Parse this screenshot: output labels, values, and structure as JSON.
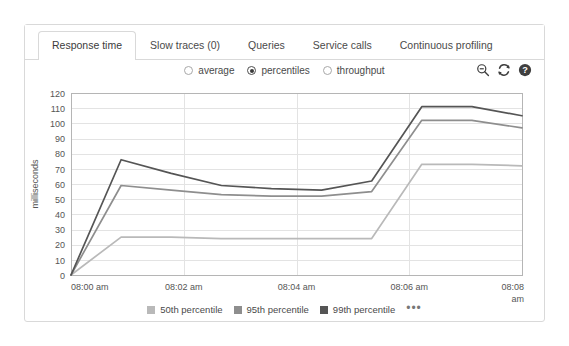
{
  "tabs": [
    {
      "label": "Response time",
      "active": true
    },
    {
      "label": "Slow traces (0)",
      "active": false
    },
    {
      "label": "Queries",
      "active": false
    },
    {
      "label": "Service calls",
      "active": false
    },
    {
      "label": "Continuous profiling",
      "active": false
    }
  ],
  "options": {
    "radios": [
      {
        "label": "average",
        "checked": false
      },
      {
        "label": "percentiles",
        "checked": true
      },
      {
        "label": "throughput",
        "checked": false
      }
    ]
  },
  "toolbar": {
    "icons": [
      {
        "name": "zoom-out-icon",
        "title": "Zoom out"
      },
      {
        "name": "refresh-icon",
        "title": "Refresh"
      },
      {
        "name": "help-icon",
        "title": "Help"
      }
    ]
  },
  "legend": {
    "items": [
      {
        "label": "50th percentile",
        "color": "#b9b9b9"
      },
      {
        "label": "95th percentile",
        "color": "#8e8e8e"
      },
      {
        "label": "99th percentile",
        "color": "#555555"
      }
    ],
    "more_label": "•••"
  },
  "chart_data": {
    "type": "line",
    "title": "",
    "xlabel": "",
    "ylabel": "milliseconds",
    "ylim": [
      0,
      120
    ],
    "yticks": [
      0,
      10,
      20,
      30,
      40,
      50,
      60,
      70,
      80,
      90,
      100,
      110,
      120
    ],
    "grid": true,
    "legend_position": "bottom",
    "x": [
      "08:00 am",
      "08:00:30 am",
      "08:01 am",
      "08:02 am",
      "08:03 am",
      "08:04 am",
      "08:05 am",
      "08:06 am",
      "08:07 am",
      "08:08 am"
    ],
    "xtick_labels": [
      "08:00 am",
      "08:02 am",
      "08:04 am",
      "08:06 am",
      "08:08 am"
    ],
    "xtick_last_wrap": "am",
    "xtick_last_main": "08:08",
    "series": [
      {
        "name": "50th percentile",
        "color": "#b9b9b9",
        "values": [
          0,
          25,
          25,
          24,
          24,
          24,
          24,
          73,
          73,
          72
        ]
      },
      {
        "name": "95th percentile",
        "color": "#8e8e8e",
        "values": [
          0,
          59,
          56,
          53,
          52,
          52,
          55,
          102,
          102,
          97
        ]
      },
      {
        "name": "99th percentile",
        "color": "#555555",
        "values": [
          0,
          76,
          67,
          59,
          57,
          56,
          62,
          111,
          111,
          105
        ]
      }
    ]
  }
}
